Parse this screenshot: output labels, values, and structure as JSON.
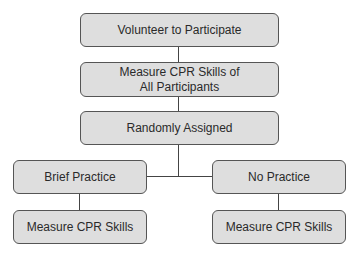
{
  "diagram": {
    "type": "flowchart",
    "nodes": {
      "volunteer": "Volunteer to Participate",
      "measure_all_line1": "Measure CPR Skills of",
      "measure_all_line2": "All Participants",
      "random": "Randomly Assigned",
      "brief": "Brief Practice",
      "none": "No Practice",
      "measure_brief": "Measure CPR Skills",
      "measure_none": "Measure CPR Skills"
    },
    "edges": [
      [
        "Volunteer to Participate",
        "Measure CPR Skills of All Participants"
      ],
      [
        "Measure CPR Skills of All Participants",
        "Randomly Assigned"
      ],
      [
        "Randomly Assigned",
        "Brief Practice"
      ],
      [
        "Randomly Assigned",
        "No Practice"
      ],
      [
        "Brief Practice",
        "Measure CPR Skills"
      ],
      [
        "No Practice",
        "Measure CPR Skills"
      ]
    ],
    "colors": {
      "box_fill": "#dedede",
      "box_border": "#555555",
      "line": "#444444"
    }
  }
}
